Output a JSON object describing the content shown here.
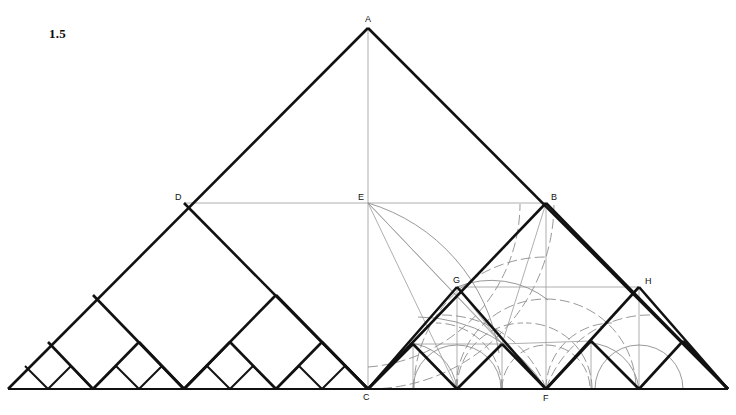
{
  "figure": {
    "number": "1.5",
    "caption_label": "1.5",
    "kind": "geometric-construction",
    "background": "#ffffff",
    "ink": "#111111",
    "arc_color": "#8a8a8a",
    "thin_color": "#9a9a9a",
    "width": 736,
    "height": 415
  },
  "points": [
    {
      "id": "A",
      "label": "A",
      "x": 368,
      "y": 28,
      "lx": 365,
      "ly": 22,
      "role": "apex"
    },
    {
      "id": "D",
      "label": "D",
      "x": 184,
      "y": 203,
      "lx": 175,
      "ly": 200,
      "role": "left-midpoint"
    },
    {
      "id": "E",
      "label": "E",
      "x": 368,
      "y": 203,
      "lx": 358,
      "ly": 200,
      "role": "center"
    },
    {
      "id": "B",
      "label": "B",
      "x": 546,
      "y": 203,
      "lx": 551,
      "ly": 200,
      "role": "right-midpoint"
    },
    {
      "id": "G",
      "label": "G",
      "x": 457,
      "y": 287,
      "lx": 455,
      "ly": 283,
      "role": "inner-right"
    },
    {
      "id": "H",
      "label": "H",
      "x": 639,
      "y": 287,
      "lx": 645,
      "ly": 284,
      "role": "outer-right"
    },
    {
      "id": "C",
      "label": "C",
      "x": 368,
      "y": 389,
      "lx": 363,
      "ly": 400,
      "role": "base-center"
    },
    {
      "id": "F",
      "label": "F",
      "x": 546,
      "y": 389,
      "lx": 543,
      "ly": 401,
      "role": "base-right"
    }
  ],
  "geometry": {
    "baseline_y": 389,
    "base_left_x": 8,
    "base_right_x": 728,
    "apex": {
      "x": 368,
      "y": 28
    },
    "half_span": 360,
    "recursion_depth": 4,
    "description": "Right isosceles triangle subdivided recursively into nested squares and half-squares; self-similar Pythagorean staircase along the base."
  },
  "arcs": {
    "center_E": {
      "cx": 368,
      "cy": 203,
      "radii": [
        186,
        262
      ]
    },
    "center_F": {
      "cx": 546,
      "cy": 389,
      "radii": [
        52,
        92,
        130
      ]
    },
    "center_C2": {
      "cx": 457,
      "cy": 389,
      "radii": [
        44,
        66
      ]
    },
    "center_H": {
      "cx": 639,
      "cy": 389,
      "radii": [
        44,
        66
      ]
    },
    "style": "dashed-thin-gray"
  },
  "legend": {
    "vertex_labels": [
      "A",
      "B",
      "C",
      "D",
      "E",
      "F",
      "G",
      "H"
    ]
  }
}
